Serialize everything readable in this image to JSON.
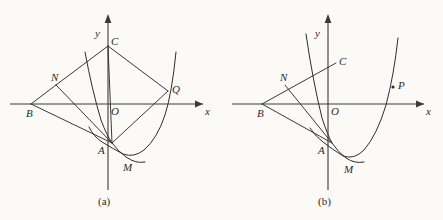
{
  "figure": {
    "background_color": "#fbfaf7",
    "ink_color": "#2e2e2e",
    "width": 443,
    "height": 220
  },
  "panels": [
    {
      "id": "a",
      "caption": "(a)",
      "origin": {
        "x": 108,
        "y": 104
      },
      "axis_labels": {
        "x": "x",
        "y": "y",
        "origin": "O"
      },
      "points": [
        {
          "name": "C",
          "label": "C",
          "x": 108,
          "y": 46,
          "label_dx": 5,
          "label_dy": -11,
          "dot": false
        },
        {
          "name": "N",
          "label": "N",
          "x": 56,
          "y": 85,
          "label_dx": -3,
          "label_dy": -12,
          "dot": false
        },
        {
          "name": "Q",
          "label": "Q",
          "x": 168,
          "y": 91,
          "label_dx": 6,
          "label_dy": -4,
          "dot": false
        },
        {
          "name": "B",
          "label": "B",
          "x": 31,
          "y": 104,
          "label_dx": -3,
          "label_dy": 3,
          "dot": false
        },
        {
          "name": "A",
          "label": "A",
          "x": 111,
          "y": 143,
          "label_dx": -12,
          "label_dy": 0,
          "dot": false
        },
        {
          "name": "M",
          "label": "M",
          "x": 127,
          "y": 156,
          "label_dx": -2,
          "label_dy": 6,
          "dot": false
        }
      ],
      "curves": [
        {
          "name": "wide-parabola",
          "d": "M 89 127 Q 94 137 102 142 Q 112 148 123 154 Q 134 158 144 150 Q 157 139 165 115 Q 172 93 176 52"
        },
        {
          "name": "narrow-parabola",
          "d": "M 85 52 Q 92 90 101 120 Q 107 136 112 143 Q 118 151 126 157 Q 136 164 145 162"
        }
      ],
      "chords": [
        {
          "name": "segment-B-N",
          "x1": 31,
          "y1": 104,
          "x2": 56,
          "y2": 85
        },
        {
          "name": "segment-N-C",
          "x1": 56,
          "y1": 85,
          "x2": 108,
          "y2": 46
        },
        {
          "name": "segment-C-Q",
          "x1": 108,
          "y1": 46,
          "x2": 168,
          "y2": 91
        },
        {
          "name": "segment-N-A",
          "x1": 56,
          "y1": 85,
          "x2": 112,
          "y2": 143
        },
        {
          "name": "segment-B-A",
          "x1": 31,
          "y1": 104,
          "x2": 112,
          "y2": 143
        },
        {
          "name": "segment-C-A",
          "x1": 108,
          "y1": 46,
          "x2": 112,
          "y2": 143
        },
        {
          "name": "segment-Q-A",
          "x1": 168,
          "y1": 91,
          "x2": 112,
          "y2": 143
        }
      ]
    },
    {
      "id": "b",
      "caption": "(b)",
      "origin": {
        "x": 328,
        "y": 104
      },
      "axis_labels": {
        "x": "x",
        "y": "y",
        "origin": "O"
      },
      "points": [
        {
          "name": "C",
          "label": "C",
          "x": 334,
          "y": 64,
          "label_dx": 5,
          "label_dy": -10,
          "dot": false
        },
        {
          "name": "N",
          "label": "N",
          "x": 285,
          "y": 85,
          "label_dx": -3,
          "label_dy": -12,
          "dot": false
        },
        {
          "name": "P",
          "label": "P",
          "x": 393,
          "y": 87,
          "label_dx": 5,
          "label_dy": -5,
          "dot": true
        },
        {
          "name": "B",
          "label": "B",
          "x": 262,
          "y": 104,
          "label_dx": -3,
          "label_dy": 3,
          "dot": false
        },
        {
          "name": "A",
          "label": "A",
          "x": 331,
          "y": 143,
          "label_dx": -12,
          "label_dy": 0,
          "dot": false
        },
        {
          "name": "M",
          "label": "M",
          "x": 348,
          "y": 158,
          "label_dx": -2,
          "label_dy": 6,
          "dot": false
        }
      ],
      "curves": [
        {
          "name": "wide-parabola",
          "d": "M 310 128 Q 316 137 323 142 Q 332 149 343 156 Q 354 160 364 150 Q 377 135 386 105 Q 394 75 398 38"
        },
        {
          "name": "narrow-parabola",
          "d": "M 306 34 Q 313 82 322 118 Q 328 136 332 143 Q 338 152 346 158 Q 355 164 364 162"
        }
      ],
      "chords": [
        {
          "name": "segment-B-N-C",
          "x1": 262,
          "y1": 104,
          "x2": 336,
          "y2": 63
        },
        {
          "name": "segment-N-A",
          "x1": 285,
          "y1": 85,
          "x2": 332,
          "y2": 143
        },
        {
          "name": "segment-B-A",
          "x1": 262,
          "y1": 104,
          "x2": 332,
          "y2": 143
        }
      ]
    }
  ]
}
